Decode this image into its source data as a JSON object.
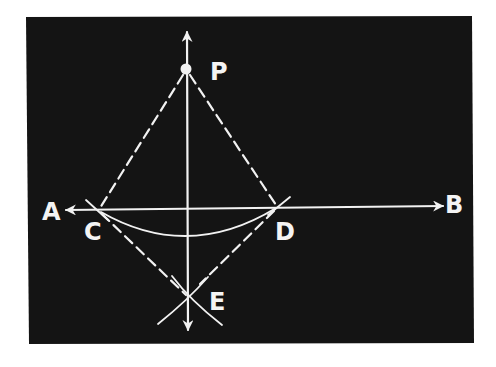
{
  "diagram": {
    "colors": {
      "background": "#ffffff",
      "board": "#141414",
      "ink": "#f2f2f2"
    },
    "labels": {
      "P": "P",
      "A": "A",
      "B": "B",
      "C": "C",
      "D": "D",
      "E": "E"
    },
    "points": {
      "P": [
        186,
        69
      ],
      "C": [
        99,
        210
      ],
      "D": [
        277,
        207
      ],
      "E": [
        188,
        298
      ]
    },
    "elements": [
      {
        "type": "line",
        "name": "line-AB",
        "from": "A",
        "to": "B",
        "arrows": "both"
      },
      {
        "type": "line",
        "name": "perpendicular-PE",
        "arrows": "both"
      },
      {
        "type": "dashed",
        "name": "segment-PC"
      },
      {
        "type": "dashed",
        "name": "segment-PD"
      },
      {
        "type": "dashed",
        "name": "segment-CE"
      },
      {
        "type": "dashed",
        "name": "segment-DE"
      },
      {
        "type": "arc",
        "name": "arc-CD",
        "center": "P"
      },
      {
        "type": "arc",
        "name": "arc-from-C",
        "through": "E"
      },
      {
        "type": "arc",
        "name": "arc-from-D",
        "through": "E"
      }
    ]
  }
}
